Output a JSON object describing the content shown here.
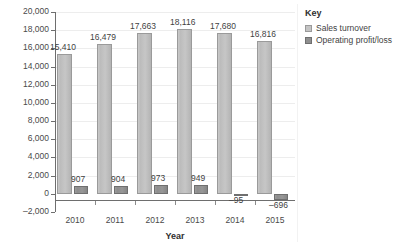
{
  "chart_data": {
    "type": "bar",
    "title": "",
    "xlabel": "Year",
    "ylabel": "",
    "categories": [
      "2010",
      "2011",
      "2012",
      "2013",
      "2014",
      "2015"
    ],
    "series": [
      {
        "name": "Sales turnover",
        "color": "#c4c4c4",
        "values": [
          15410,
          16479,
          17663,
          18116,
          17680,
          16816
        ],
        "labels": [
          "15,410",
          "16,479",
          "17,663",
          "18,116",
          "17,680",
          "16,816"
        ]
      },
      {
        "name": "Operating profit/loss",
        "color": "#8f8f8f",
        "values": [
          907,
          904,
          973,
          949,
          -95,
          -696
        ],
        "labels": [
          "907",
          "904",
          "973",
          "949",
          "–95",
          "–696"
        ]
      }
    ],
    "ylim": [
      -2000,
      20000
    ],
    "yticks": [
      20000,
      18000,
      16000,
      14000,
      12000,
      10000,
      8000,
      6000,
      4000,
      2000,
      0,
      -2000
    ],
    "ytick_labels": [
      "20,000",
      "18,000",
      "16,000",
      "14,000",
      "12,000",
      "10,000",
      "8,000",
      "6,000",
      "4,000",
      "2,000",
      "0",
      "–2,000"
    ],
    "grid": true,
    "legend_position": "right"
  },
  "legend": {
    "title": "Key",
    "items": [
      {
        "label": "Sales turnover",
        "swatch": "legend-swatch-sales"
      },
      {
        "label": "Operating profit/loss",
        "swatch": "legend-swatch-profit"
      }
    ]
  }
}
